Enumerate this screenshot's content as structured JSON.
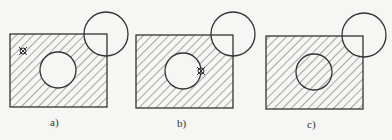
{
  "figure": {
    "panels": [
      {
        "id": "a",
        "label": "a)",
        "marker": "on-region-point"
      },
      {
        "id": "b",
        "label": "b)",
        "marker": "on-inner-circle-boundary"
      },
      {
        "id": "c",
        "label": "c)",
        "marker": "none-inner-circle-hatched"
      }
    ],
    "colors": {
      "stroke": "#333333",
      "hatch": "#555555",
      "background": "#f6f6f4"
    }
  }
}
